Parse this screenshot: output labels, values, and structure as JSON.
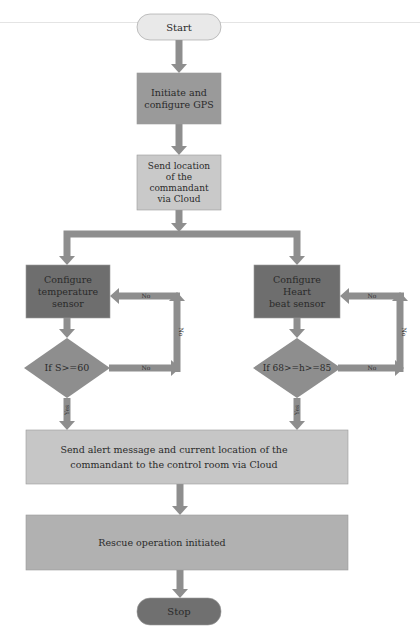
{
  "flowchart": {
    "colors": {
      "arrow": "#8e8e8e",
      "start_fill": "#e9e9e9",
      "gps_fill": "#9a9a9a",
      "location_fill": "#c9c9c9",
      "sensor_fill": "#6e6e6e",
      "diamond_fill": "#8e8e8e",
      "alert_fill": "#c6c6c6",
      "rescue_fill": "#b1b1b1",
      "stop_fill": "#707070",
      "text": "#2a2a2a"
    },
    "nodes": {
      "start": {
        "label": [
          "Start"
        ]
      },
      "gps": {
        "label": [
          "Initiate and",
          "configure GPS"
        ]
      },
      "send_location": {
        "label": [
          "Send location",
          "of the",
          "commandant",
          "via Cloud"
        ]
      },
      "temp_sensor": {
        "label": [
          "Configure",
          "temperature",
          "sensor"
        ]
      },
      "heart_sensor": {
        "label": [
          "Configure",
          "Heart",
          "beat sensor"
        ]
      },
      "temp_decision": {
        "label": [
          "If S>=60"
        ]
      },
      "heart_decision": {
        "label": [
          "If 68>=h>=85"
        ]
      },
      "alert": {
        "label": [
          "Send alert message and current location of the",
          "commandant to the control room via Cloud"
        ]
      },
      "rescue": {
        "label": [
          "Rescue operation initiated"
        ]
      },
      "stop": {
        "label": [
          "Stop"
        ]
      }
    },
    "edge_labels": {
      "no": "No",
      "yes": "Yes"
    }
  }
}
